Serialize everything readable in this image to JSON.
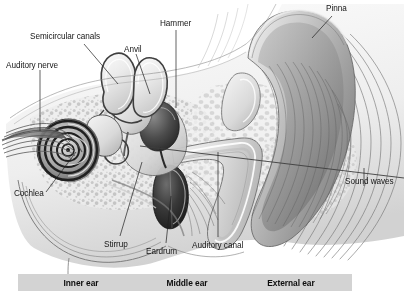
{
  "figure": {
    "background_color": "#ffffff",
    "ink_color": "#161616"
  },
  "labels": [
    {
      "id": "semicircular-canals",
      "text": "Semicircular canals",
      "x": 30,
      "y": 33
    },
    {
      "id": "auditory-nerve",
      "text": "Auditory nerve",
      "x": 6,
      "y": 62
    },
    {
      "id": "anvil",
      "text": "Anvil",
      "x": 124,
      "y": 46
    },
    {
      "id": "hammer",
      "text": "Hammer",
      "x": 160,
      "y": 20
    },
    {
      "id": "pinna",
      "text": "Pinna",
      "x": 326,
      "y": 5
    },
    {
      "id": "sound-waves",
      "text": "Sound waves",
      "x": 345,
      "y": 178
    },
    {
      "id": "cochlea",
      "text": "Cochlea",
      "x": 14,
      "y": 190
    },
    {
      "id": "stirrup",
      "text": "Stirrup",
      "x": 104,
      "y": 241
    },
    {
      "id": "eardrum",
      "text": "Eardrum",
      "x": 146,
      "y": 248
    },
    {
      "id": "auditory-canal",
      "text": "Auditory canal",
      "x": 192,
      "y": 242
    }
  ],
  "region_band": {
    "background_color": "#d3d3d3",
    "segments": [
      {
        "id": "inner-ear",
        "text": "Inner ear",
        "left": 0,
        "width": 126
      },
      {
        "id": "middle-ear",
        "text": "Middle ear",
        "left": 126,
        "width": 86
      },
      {
        "id": "external-ear",
        "text": "External ear",
        "left": 212,
        "width": 122
      }
    ]
  },
  "anatomy": {
    "parts": [
      "pinna",
      "auditory-canal",
      "eardrum",
      "hammer",
      "anvil",
      "stirrup",
      "semicircular-canals",
      "cochlea",
      "auditory-nerve",
      "sound-waves"
    ]
  }
}
